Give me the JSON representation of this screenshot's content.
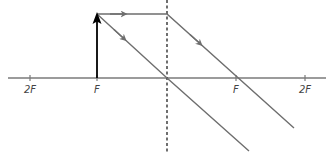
{
  "diagram": {
    "type": "converging-lens-ray-diagram",
    "colors": {
      "axis": "#7a7a7a",
      "ray": "#6e6e6e",
      "object": "#000000",
      "lens": "#222222",
      "label": "#444444"
    },
    "axis": {
      "y": 78,
      "x_start": 8,
      "x_end": 326
    },
    "lens": {
      "x": 167,
      "y_top": 0,
      "y_bottom": 153,
      "style": "dashed"
    },
    "ticks": [
      {
        "id": "2F-left",
        "x": 30,
        "label": "2F"
      },
      {
        "id": "F-left",
        "x": 97,
        "label": "F"
      },
      {
        "id": "F-right",
        "x": 236,
        "label": "F"
      },
      {
        "id": "2F-right",
        "x": 305,
        "label": "2F"
      }
    ],
    "object": {
      "x": 97,
      "y_base": 78,
      "y_tip": 13,
      "position": "at F"
    },
    "rays": [
      {
        "name": "parallel-ray",
        "points": [
          [
            97,
            14
          ],
          [
            167,
            14
          ],
          [
            294,
            128
          ]
        ],
        "description": "parallel to axis, refracts through right F"
      },
      {
        "name": "center-ray",
        "points": [
          [
            97,
            14
          ],
          [
            167,
            78
          ],
          [
            249,
            151
          ]
        ],
        "description": "passes straight through optical centre"
      }
    ]
  }
}
